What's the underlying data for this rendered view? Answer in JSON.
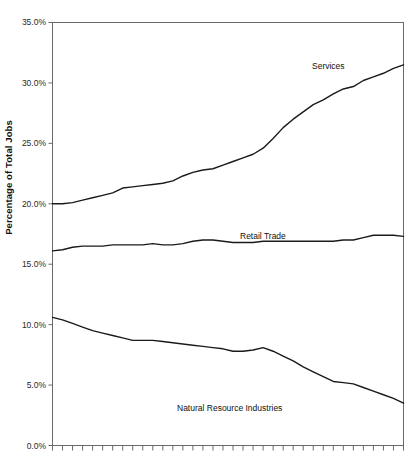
{
  "chart_data": {
    "type": "line",
    "title": "",
    "xlabel": "",
    "ylabel": "Percentage of Total Jobs",
    "ylim": [
      0,
      35
    ],
    "ytick_labels": [
      "35.0%",
      "30.0%",
      "25.0%",
      "20.0%",
      "15.0%",
      "10.0%",
      "5.0%",
      "0.0%"
    ],
    "ytick_values": [
      35,
      30,
      25,
      20,
      15,
      10,
      5,
      0
    ],
    "grid": false,
    "legend_position": "inline-annotations",
    "x_tick_count": 36,
    "x": [
      0,
      1,
      2,
      3,
      4,
      5,
      6,
      7,
      8,
      9,
      10,
      11,
      12,
      13,
      14,
      15,
      16,
      17,
      18,
      19,
      20,
      21,
      22,
      23,
      24,
      25,
      26,
      27,
      28,
      29,
      30,
      31,
      32,
      33,
      34,
      35
    ],
    "series": [
      {
        "name": "Services",
        "label": "Services",
        "color": "#1a1a1a",
        "values": [
          20.0,
          20.0,
          20.1,
          20.3,
          20.5,
          20.7,
          20.9,
          21.3,
          21.4,
          21.5,
          21.6,
          21.7,
          21.9,
          22.3,
          22.6,
          22.8,
          22.9,
          23.2,
          23.5,
          23.8,
          24.1,
          24.6,
          25.4,
          26.3,
          27.0,
          27.6,
          28.2,
          28.6,
          29.1,
          29.5,
          29.7,
          30.2,
          30.5,
          30.8,
          31.2,
          31.5
        ]
      },
      {
        "name": "Retail Trade",
        "label": "Retail Trade",
        "color": "#1a1a1a",
        "values": [
          16.1,
          16.2,
          16.4,
          16.5,
          16.5,
          16.5,
          16.6,
          16.6,
          16.6,
          16.6,
          16.7,
          16.6,
          16.6,
          16.7,
          16.9,
          17.0,
          17.0,
          16.9,
          16.8,
          16.8,
          16.8,
          16.9,
          16.9,
          16.9,
          16.9,
          16.9,
          16.9,
          16.9,
          16.9,
          17.0,
          17.0,
          17.2,
          17.4,
          17.4,
          17.4,
          17.3
        ]
      },
      {
        "name": "Natural Resource Industries",
        "label": "Natural Resource Industries",
        "color": "#1a1a1a",
        "values": [
          10.6,
          10.4,
          10.1,
          9.8,
          9.5,
          9.3,
          9.1,
          8.9,
          8.7,
          8.7,
          8.7,
          8.6,
          8.5,
          8.4,
          8.3,
          8.2,
          8.1,
          8.0,
          7.8,
          7.8,
          7.9,
          8.1,
          7.8,
          7.4,
          7.0,
          6.5,
          6.1,
          5.7,
          5.3,
          5.2,
          5.1,
          4.8,
          4.5,
          4.2,
          3.9,
          3.5
        ]
      }
    ],
    "annotations": [
      {
        "text": "Services",
        "x_px": 312,
        "y_px": 67
      },
      {
        "text": "Retail Trade",
        "x_px": 265,
        "y_px": 237
      },
      {
        "text": "Natural Resource Industries",
        "x_px": 247,
        "y_px": 409
      }
    ]
  }
}
